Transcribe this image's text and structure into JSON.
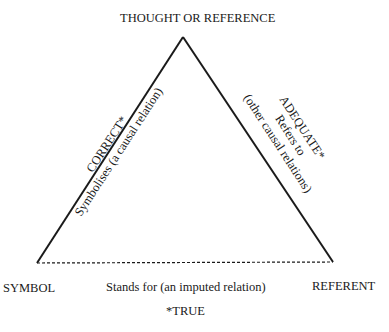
{
  "diagram": {
    "nodes": {
      "apex": "THOUGHT OR REFERENCE",
      "left": "SYMBOL",
      "right": "REFERENT"
    },
    "edges": {
      "left_side": {
        "qualifier": "CORRECT*",
        "relation": "Symbolises (a causal relation)",
        "style": "solid"
      },
      "right_side": {
        "qualifier": "ADEQUATE*",
        "relation": "Refers to",
        "note": "(other causal relations)",
        "style": "solid"
      },
      "base": {
        "relation": "Stands for (an imputed relation)",
        "style": "dashed"
      }
    },
    "footnote": "*TRUE",
    "line_color": "#1a1a1a"
  }
}
